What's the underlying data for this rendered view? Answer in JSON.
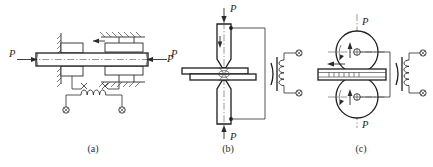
{
  "figure": {
    "background_color": "#ffffff",
    "line_color": "#2b2b2b",
    "width": 433,
    "height": 167,
    "panels": [
      {
        "id": "a",
        "caption": "(a)",
        "description": "horizontal-bar-axial-compression-with-coil",
        "force_labels": [
          {
            "name": "force-label-left",
            "text": "P",
            "arrow_direction": "right"
          },
          {
            "name": "force-label-right",
            "text": "P",
            "arrow_direction": "left"
          }
        ],
        "coil": {
          "name": "sensing-coil",
          "turns": 4,
          "orientation": "horizontal"
        },
        "terminals": [
          {
            "name": "terminal-left",
            "symbol": "circle-x"
          },
          {
            "name": "terminal-right",
            "symbol": "circle-x"
          }
        ],
        "supports": [
          {
            "name": "support-upper-left",
            "style": "hatched"
          },
          {
            "name": "support-upper-right",
            "style": "hatched"
          },
          {
            "name": "support-lower-left",
            "style": "hatched"
          },
          {
            "name": "support-lower-right",
            "style": "hatched"
          }
        ]
      },
      {
        "id": "b",
        "caption": "(b)",
        "description": "vertical-tapered-electrodes-compressing-plate-with-coil",
        "force_labels": [
          {
            "name": "force-label-top",
            "text": "P",
            "arrow_direction": "down"
          },
          {
            "name": "force-label-bottom",
            "text": "P",
            "arrow_direction": "up"
          },
          {
            "name": "force-label-side",
            "text": "P",
            "arrow_direction": "none"
          }
        ],
        "coil": {
          "name": "sensing-coil",
          "turns": 4,
          "orientation": "vertical"
        },
        "terminals": [
          {
            "name": "terminal-top",
            "symbol": "circle-x"
          },
          {
            "name": "terminal-bottom",
            "symbol": "circle-x"
          }
        ],
        "contact_nodes": [
          {
            "name": "contact-node-upper",
            "symbol": "filled-dot"
          },
          {
            "name": "contact-node-lower",
            "symbol": "filled-dot"
          }
        ]
      },
      {
        "id": "c",
        "caption": "(c)",
        "description": "twin-roller-seam-weld-with-strip-and-coil",
        "force_labels": [
          {
            "name": "force-label-top",
            "text": "P",
            "arrow_direction": "down"
          },
          {
            "name": "force-label-bottom",
            "text": "P",
            "arrow_direction": "up"
          }
        ],
        "rollers": [
          {
            "name": "roller-upper",
            "rotation": "arrow-ccw"
          },
          {
            "name": "roller-lower",
            "rotation": "arrow-ccw"
          }
        ],
        "strip": {
          "name": "workpiece-strip",
          "feed_direction": "left",
          "hatch_marks": 7
        },
        "coil": {
          "name": "sensing-coil",
          "turns": 4,
          "orientation": "vertical"
        },
        "terminals": [
          {
            "name": "terminal-top",
            "symbol": "circle-x"
          },
          {
            "name": "terminal-bottom",
            "symbol": "circle-x"
          }
        ]
      }
    ]
  }
}
